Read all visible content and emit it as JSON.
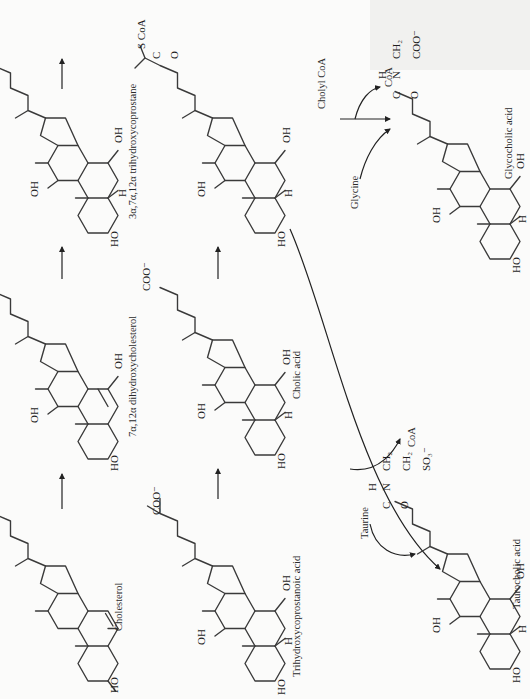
{
  "figure": {
    "orientation": "rotated -90 degrees (text reads bottom to top)",
    "compounds": [
      {
        "id": "cholesterol",
        "label": "Cholesterol",
        "substituents": [
          "HO"
        ]
      },
      {
        "id": "dihydroxycholesterol",
        "label": "7α,12α dihydroxycholesterol",
        "substituents": [
          "HO",
          "OH",
          "OH"
        ]
      },
      {
        "id": "trihydroxycoprostane",
        "label": "3α,7α,12α trihydroxycoprostane",
        "substituents": [
          "HO",
          "OH",
          "OH",
          "H"
        ]
      },
      {
        "id": "trihydroxycoprostanoic",
        "label": "Trihydroxycoprostanoic acid",
        "substituents": [
          "HO",
          "OH",
          "OH",
          "H",
          "COO⁻"
        ]
      },
      {
        "id": "cholic",
        "label": "Cholic acid",
        "substituents": [
          "HO",
          "OH",
          "OH",
          "H",
          "COO⁻"
        ]
      },
      {
        "id": "cholyl_coa",
        "label": "",
        "substituents": [
          "HO",
          "OH",
          "OH",
          "H",
          "S CoA",
          "C",
          "O"
        ]
      },
      {
        "id": "glycocholic",
        "label": "Glycocholic acid",
        "substituents": [
          "HO",
          "OH",
          "OH",
          "H"
        ],
        "side_chain": {
          "H": "H",
          "N": "N",
          "CH2": "CH₂",
          "C": "C",
          "O": "O",
          "COO": "COO⁻"
        }
      },
      {
        "id": "taurocholic",
        "label": "Taurocholic acid",
        "substituents": [
          "HO",
          "OH",
          "OH",
          "H"
        ],
        "side_chain": {
          "H": "H",
          "N": "N",
          "CH2a": "CH₂",
          "CH2b": "CH₂",
          "SO3": "SO₃⁻",
          "C": "C",
          "O": "O"
        }
      }
    ],
    "reagents": {
      "cholyl_coa": "Cholyl CoA",
      "coa_top": "CoA",
      "glycine": "Glycine",
      "taurine": "Taurine",
      "coa_bottom": "CoA"
    },
    "atoms": {
      "HO": "HO",
      "OH": "OH",
      "H": "H",
      "COO": "COO⁻",
      "SCoA": "S CoA",
      "C": "C",
      "O": "O"
    }
  }
}
